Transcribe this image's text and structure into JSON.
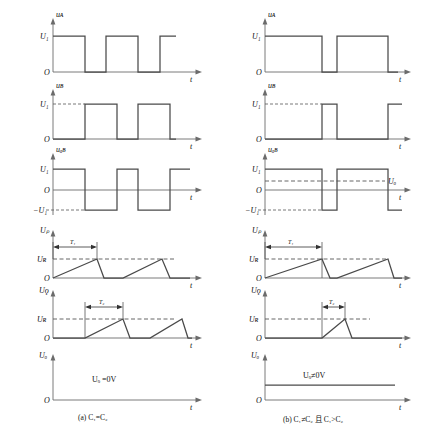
{
  "figure": {
    "title": "",
    "panels": [
      {
        "id": "panel-a",
        "caption": "(a) C₁=C₂",
        "rows": [
          {
            "id": "row-ua",
            "y_label": "uᴀ",
            "x_label": "t",
            "origin_label": "O",
            "level_labels": [
              "U₁"
            ],
            "waveform": "pulse-train-narrow",
            "dashed_level": false
          },
          {
            "id": "row-ub",
            "y_label": "uʙ",
            "x_label": "t",
            "origin_label": "O",
            "level_labels": [
              "U₁"
            ],
            "waveform": "pulse-train-offset",
            "dashed_level": true
          },
          {
            "id": "row-uab",
            "y_label": "uₐʙ",
            "x_label": "t",
            "origin_label": "O",
            "level_labels": [
              "U₁",
              "−U₁"
            ],
            "waveform": "bipolar-square",
            "dc_label": "",
            "dc_line": false
          },
          {
            "id": "row-up",
            "y_label": "Uₚ",
            "x_label": "t",
            "origin_label": "O",
            "level_labels": [
              "Uʀ"
            ],
            "dim_label": "T₁",
            "waveform": "sawtooth-ramp"
          },
          {
            "id": "row-uq",
            "y_label": "Uǫ",
            "x_label": "t",
            "origin_label": "O",
            "level_labels": [
              "Uʀ"
            ],
            "dim_label": "T₂",
            "waveform": "sawtooth-ramp-delayed"
          },
          {
            "id": "row-uo",
            "y_label": "Uₒ",
            "x_label": "t",
            "origin_label": "O",
            "level_labels": [],
            "annotation": "Uₒ =0V",
            "waveform": "zero-line"
          }
        ]
      },
      {
        "id": "panel-b",
        "caption": "(b) C₁≠C₂ 且 C₁>C₂",
        "rows": [
          {
            "id": "row-ua",
            "y_label": "uᴀ",
            "x_label": "t",
            "origin_label": "O",
            "level_labels": [
              "U₁"
            ],
            "waveform": "pulse-train-wide",
            "dashed_level": false
          },
          {
            "id": "row-ub",
            "y_label": "uʙ",
            "x_label": "t",
            "origin_label": "O",
            "level_labels": [
              "U₁"
            ],
            "waveform": "pulse-train-narrow-offset",
            "dashed_level": true
          },
          {
            "id": "row-uab",
            "y_label": "uₐʙ",
            "x_label": "t",
            "origin_label": "O",
            "level_labels": [
              "U₁",
              "−U₁"
            ],
            "waveform": "bipolar-square-asym",
            "dc_label": "Uₒ",
            "dc_line": true
          },
          {
            "id": "row-up",
            "y_label": "Uₚ",
            "x_label": "t",
            "origin_label": "O",
            "level_labels": [
              "Uʀ"
            ],
            "dim_label": "T₁",
            "waveform": "sawtooth-ramp-long"
          },
          {
            "id": "row-uq",
            "y_label": "Uǫ",
            "x_label": "t",
            "origin_label": "O",
            "level_labels": [
              "Uʀ"
            ],
            "dim_label": "T₂",
            "waveform": "sawtooth-ramp-short"
          },
          {
            "id": "row-uo",
            "y_label": "Uₒ",
            "x_label": "t",
            "origin_label": "O",
            "level_labels": [],
            "annotation": "Uₒ≠0V",
            "waveform": "dc-level"
          }
        ]
      }
    ],
    "colors": {
      "waveform": "#4a4a4a",
      "axis": "#6b6b6b",
      "dashed": "#555555",
      "text": "#1a1a1a",
      "background": "#ffffff"
    }
  }
}
